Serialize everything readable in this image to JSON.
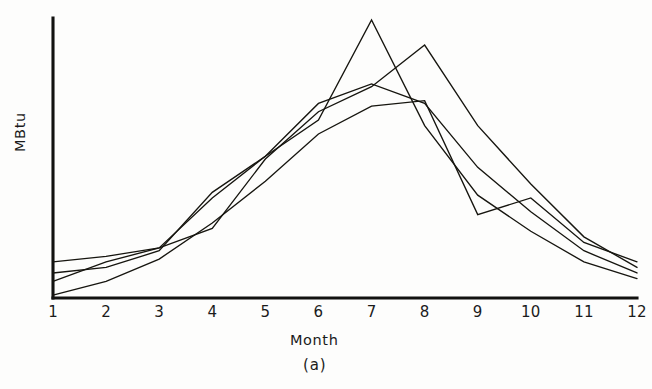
{
  "figure": {
    "caption": "(a)",
    "background_color": "#fdfdfc",
    "ink_color": "#16150f"
  },
  "axes": {
    "x_title": "Month",
    "y_title": "MBtu",
    "x_tick_labels": [
      "1",
      "2",
      "3",
      "4",
      "5",
      "6",
      "7",
      "8",
      "9",
      "10",
      "11",
      "12"
    ],
    "y_tick_labels": []
  },
  "chart_data": {
    "type": "line",
    "title": "",
    "subtitle": "",
    "xlabel": "Month",
    "ylabel": "MBtu",
    "caption": "(a)",
    "x": [
      1,
      2,
      3,
      4,
      5,
      6,
      7,
      8,
      9,
      10,
      11,
      12
    ],
    "xlim": [
      1,
      12
    ],
    "ylim": [
      0,
      100
    ],
    "grid": false,
    "legend": "none",
    "axis_style": "left-and-bottom-spines-only",
    "y_axis_ticks_shown": false,
    "series": [
      {
        "name": "series-1",
        "values": [
          9,
          11,
          17,
          38,
          51,
          64,
          100,
          62,
          37,
          24,
          13,
          7
        ]
      },
      {
        "name": "series-2",
        "values": [
          13,
          15,
          18,
          25,
          50,
          67,
          76,
          91,
          62,
          41,
          22,
          11
        ]
      },
      {
        "name": "series-3",
        "values": [
          6,
          13,
          18,
          36,
          51,
          70,
          77,
          70,
          47,
          31,
          17,
          9
        ]
      },
      {
        "name": "series-4",
        "values": [
          1,
          6,
          14,
          27,
          42,
          59,
          69,
          71,
          30,
          36,
          20,
          13
        ]
      }
    ]
  }
}
